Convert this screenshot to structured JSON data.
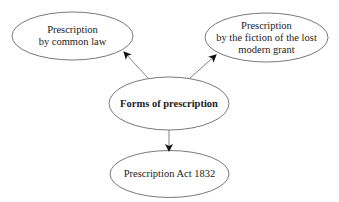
{
  "diagram": {
    "type": "mind-map",
    "colors": {
      "stroke": "#555555",
      "arrow": "#111111",
      "text": "#222222",
      "background": "#ffffff"
    },
    "central_node": {
      "id": "forms",
      "label": "Forms of prescription"
    },
    "nodes": [
      {
        "id": "common-law",
        "label": "Prescription\nby common law"
      },
      {
        "id": "lost-modern-grant",
        "label": "Prescription\nby the fiction of the lost\nmodern grant"
      },
      {
        "id": "act-1832",
        "label": "Prescription Act 1832"
      }
    ],
    "edges": [
      {
        "from": "forms",
        "to": "common-law"
      },
      {
        "from": "forms",
        "to": "lost-modern-grant"
      },
      {
        "from": "forms",
        "to": "act-1832"
      }
    ]
  }
}
